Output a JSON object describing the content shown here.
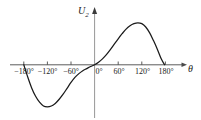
{
  "figure": {
    "background_color": "#ffffff",
    "line_color": "#1a1a1a",
    "axis_color": "#4a4a4a"
  },
  "axes": {
    "y_axis_label": "U",
    "y_axis_subscript": "2",
    "x_axis_label": "θ"
  },
  "chart_data": {
    "type": "line",
    "title": "",
    "subtitle": "",
    "xlabel": "θ",
    "ylabel": "U₂",
    "grid": false,
    "legend": false,
    "xlim": [
      -200,
      200
    ],
    "ylim": [
      -1.15,
      1.15
    ],
    "xticks": [
      -180,
      -120,
      -60,
      0,
      60,
      120,
      180
    ],
    "xtick_labels": [
      "−180°",
      "−120°",
      "−60°",
      "0°",
      "60°",
      "120°",
      "180°"
    ],
    "yticks": [],
    "ytick_labels": [],
    "series": [
      {
        "name": "U2",
        "x": [
          -180,
          -170,
          -160,
          -150,
          -140,
          -130,
          -120,
          -110,
          -100,
          -90,
          -80,
          -70,
          -60,
          -50,
          -40,
          -30,
          -20,
          -10,
          0,
          10,
          20,
          30,
          40,
          50,
          60,
          70,
          80,
          90,
          100,
          110,
          120,
          130,
          140,
          150,
          160,
          170,
          178
        ],
        "y": [
          0.0,
          -0.29,
          -0.55,
          -0.75,
          -0.89,
          -0.98,
          -1.0,
          -0.98,
          -0.92,
          -0.82,
          -0.7,
          -0.56,
          -0.42,
          -0.3,
          -0.21,
          -0.14,
          -0.09,
          -0.04,
          0.0,
          0.06,
          0.14,
          0.24,
          0.36,
          0.49,
          0.62,
          0.74,
          0.85,
          0.93,
          0.98,
          1.0,
          0.98,
          0.9,
          0.76,
          0.57,
          0.36,
          0.13,
          0.0
        ]
      }
    ],
    "annotations": []
  },
  "tick_labels": [
    {
      "text": "−180°",
      "x_px": 24,
      "y_px": 68
    },
    {
      "text": "−120°",
      "x_px": 47.5,
      "y_px": 68
    },
    {
      "text": "−60°",
      "x_px": 71,
      "y_px": 68
    },
    {
      "text": "0°",
      "x_px": 99,
      "y_px": 68
    },
    {
      "text": "60°",
      "x_px": 119,
      "y_px": 68
    },
    {
      "text": "120°",
      "x_px": 142.5,
      "y_px": 68
    },
    {
      "text": "180°",
      "x_px": 166,
      "y_px": 68
    }
  ]
}
